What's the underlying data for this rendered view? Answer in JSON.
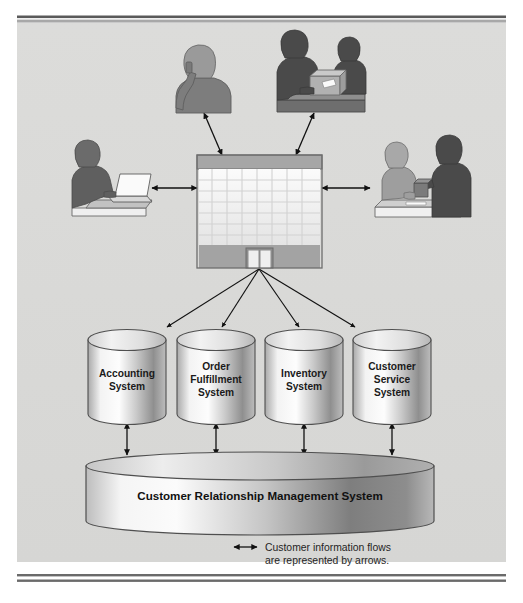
{
  "figure": {
    "type": "system-architecture-diagram",
    "background_color": "#d9d9d7",
    "page_background": "#ffffff",
    "border_color": "#5a5a5a"
  },
  "central_node": {
    "name": "company-building",
    "icon": "office-building-icon",
    "description": "Company headquarters building with grid of windows and entry doors",
    "facade_color": "#9a9a9a",
    "window_color": "#f2f2f2",
    "roof_color": "#a6a6a6"
  },
  "actors": [
    {
      "id": "phone-customer",
      "icon": "person-on-phone-icon",
      "description": "Customer talking on telephone",
      "position": "top-left",
      "fill": "#808080"
    },
    {
      "id": "counter-service",
      "icon": "two-people-at-counter-icon",
      "description": "Employee and customer at service counter with package",
      "position": "top-right",
      "fill": "#4d4d4d"
    },
    {
      "id": "online-customer",
      "icon": "person-at-laptop-icon",
      "description": "Customer using laptop computer",
      "position": "left",
      "fill": "#595959"
    },
    {
      "id": "in-store-customer",
      "icon": "two-people-at-desk-icon",
      "description": "Customer and sales representative at desk",
      "position": "right",
      "fill": "#4d4d4d"
    }
  ],
  "systems": [
    {
      "id": "accounting-system",
      "label": "Accounting\nSystem",
      "line1": "Accounting",
      "line2": "System",
      "line3": ""
    },
    {
      "id": "order-fulfillment-system",
      "label": "Order Fulfillment System",
      "line1": "Order",
      "line2": "Fulfillment",
      "line3": "System"
    },
    {
      "id": "inventory-system",
      "label": "Inventory System",
      "line1": "Inventory",
      "line2": "System",
      "line3": ""
    },
    {
      "id": "customer-service-system",
      "label": "Customer Service System",
      "line1": "Customer",
      "line2": "Service",
      "line3": "System"
    }
  ],
  "database": {
    "id": "crm-database",
    "label": "Customer Relationship Management System"
  },
  "legend": {
    "arrow_icon": "double-headed-arrow-icon",
    "line1": "Customer information flows",
    "line2": "are represented by arrows."
  },
  "connections": {
    "actor_to_building": "bidirectional",
    "building_to_systems": "one-way-down",
    "systems_to_crm": "bidirectional"
  }
}
